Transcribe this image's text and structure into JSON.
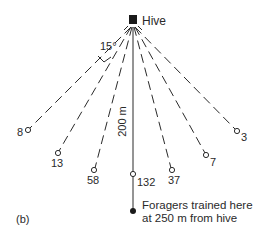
{
  "figure": {
    "panel_label": "(b)",
    "hive_label": "Hive",
    "angle_label": "15°",
    "distance_label": "200 m",
    "feeder_note_line1": "Foragers trained here",
    "feeder_note_line2": "at 250 m from hive"
  },
  "stations": [
    {
      "id": "s1",
      "count": "8"
    },
    {
      "id": "s2",
      "count": "13"
    },
    {
      "id": "s3",
      "count": "58"
    },
    {
      "id": "s4",
      "count": "132"
    },
    {
      "id": "s5",
      "count": "37"
    },
    {
      "id": "s6",
      "count": "7"
    },
    {
      "id": "s7",
      "count": "3"
    }
  ],
  "colors": {
    "ink": "#2a2a2a",
    "background": "#ffffff"
  }
}
